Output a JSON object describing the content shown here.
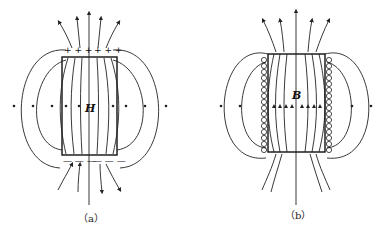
{
  "panels": [
    {
      "id": "a",
      "caption": "（a）",
      "field_symbol": "H",
      "top_charges": "+++ +++",
      "bottom_charges": "—— ——"
    },
    {
      "id": "b",
      "caption": "（b）",
      "field_symbol": "B"
    }
  ],
  "colors": {
    "line": "#222222",
    "background": "#ffffff"
  }
}
